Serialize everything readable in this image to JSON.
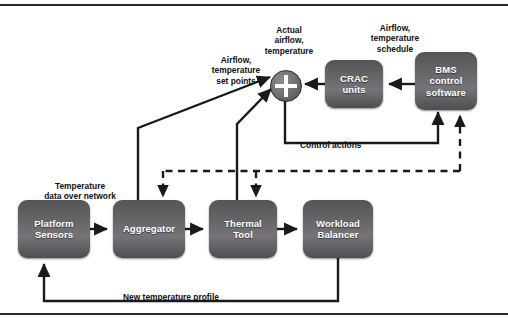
{
  "diagram": {
    "frame": {
      "top_rule": "",
      "bottom_rule": ""
    },
    "nodes": [
      {
        "id": "platform-sensors",
        "label": "Platform\nSensors",
        "x": 18,
        "y": 200,
        "w": 72,
        "h": 58
      },
      {
        "id": "aggregator",
        "label": "Aggregator",
        "x": 113,
        "y": 200,
        "w": 72,
        "h": 58
      },
      {
        "id": "thermal-tool",
        "label": "Thermal\nTool",
        "x": 209,
        "y": 200,
        "w": 68,
        "h": 58
      },
      {
        "id": "workload-balancer",
        "label": "Workload\nBalancer",
        "x": 303,
        "y": 200,
        "w": 70,
        "h": 58
      },
      {
        "id": "crac-units",
        "label": "CRAC\nunits",
        "x": 325,
        "y": 60,
        "w": 58,
        "h": 48
      },
      {
        "id": "bms-control",
        "label": "BMS\ncontrol\nsoftware",
        "x": 415,
        "y": 52,
        "w": 62,
        "h": 58
      }
    ],
    "summing_junction": {
      "id": "summing-junction",
      "symbol": "+",
      "cx": 285,
      "cy": 85,
      "r": 15
    },
    "captions": [
      {
        "id": "airflow-temperature-set-points",
        "text": "Airflow,\ntemperature\nset points",
        "x": 196,
        "y": 44,
        "w": 80
      },
      {
        "id": "actual-airflow-temperature",
        "text": "Actual\nairflow,\ntemperature",
        "x": 249,
        "y": 14,
        "w": 80
      },
      {
        "id": "airflow-temperature-schedule",
        "text": "Airflow,\ntemperature\nschedule",
        "x": 355,
        "y": 12,
        "w": 80
      },
      {
        "id": "control-actions",
        "text": "Control actions",
        "x": 300,
        "y": 129,
        "w": 100
      },
      {
        "id": "temperature-data-over-network",
        "text": "Temperature\ndata over network",
        "x": 24,
        "y": 170,
        "w": 112
      },
      {
        "id": "new-temperature-profile",
        "text": "New temperature profile",
        "x": 101,
        "y": 281,
        "w": 140
      }
    ],
    "edges": [
      {
        "id": "sensors-to-aggregator",
        "style": "solid",
        "from": "platform-sensors",
        "to": "aggregator",
        "label": ""
      },
      {
        "id": "aggregator-to-thermal",
        "style": "solid",
        "from": "aggregator",
        "to": "thermal-tool",
        "label": ""
      },
      {
        "id": "thermal-to-workload",
        "style": "solid",
        "from": "thermal-tool",
        "to": "workload-balancer",
        "label": ""
      },
      {
        "id": "bms-to-crac",
        "style": "solid",
        "from": "bms-control",
        "to": "crac-units",
        "label": "Airflow, temperature schedule"
      },
      {
        "id": "crac-to-summing",
        "style": "solid",
        "from": "crac-units",
        "to": "summing-junction",
        "label": "Actual airflow, temperature"
      },
      {
        "id": "aggregator-to-summing",
        "style": "solid",
        "from": "aggregator",
        "to": "summing-junction",
        "label": "Airflow, temperature set points"
      },
      {
        "id": "thermal-to-summing",
        "style": "solid",
        "from": "thermal-tool",
        "to": "summing-junction",
        "label": "Airflow, temperature set points"
      },
      {
        "id": "summing-to-bms",
        "style": "solid",
        "from": "summing-junction",
        "to": "bms-control",
        "label": "Control actions"
      },
      {
        "id": "workload-to-sensors",
        "style": "solid",
        "from": "workload-balancer",
        "to": "platform-sensors",
        "label": "New temperature profile"
      },
      {
        "id": "bms-feedback-to-aggregator",
        "style": "dashed",
        "from": "bms-control",
        "to": "aggregator",
        "label": ""
      },
      {
        "id": "bms-feedback-to-thermal",
        "style": "dashed",
        "from": "bms-control",
        "to": "thermal-tool",
        "label": ""
      }
    ],
    "colors": {
      "box_fill_dark": "#4e4e51",
      "box_fill_light": "#757579",
      "line": "#1a1a1a",
      "text_on_box": "#ffffff",
      "caption_text": "#111111",
      "background": "#ffffff"
    }
  }
}
